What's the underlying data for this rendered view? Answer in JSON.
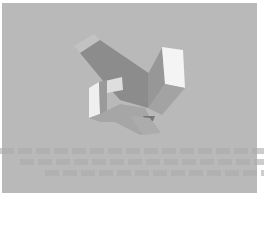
{
  "figure": {
    "background_color": "#b9b9b9",
    "page_color": "#ffffff",
    "faces": [
      {
        "name": "top-left-arm-cap",
        "color": "#c2c2c2",
        "points": "74,46 94,34 100,40 80,53"
      },
      {
        "name": "left-arm-top-face",
        "color": "#8c8c8c",
        "points": "80,53 100,40 150,74 162,70 162,88 148,108 120,100 104,82"
      },
      {
        "name": "right-block-side",
        "color": "#979797",
        "points": "148,74 162,48 165,84 148,108"
      },
      {
        "name": "right-block-front",
        "color": "#f4f4f4",
        "points": "162,47 183,50 185,88 165,84"
      },
      {
        "name": "right-block-bottom",
        "color": "#a3a3a3",
        "points": "165,84 185,88 162,115 148,108"
      },
      {
        "name": "center-window",
        "color": "#dedede",
        "points": "105,81 122,77 123,90 107,93"
      },
      {
        "name": "left-slab-front",
        "color": "#efefef",
        "points": "89,88 99,82 100,114 89,118"
      },
      {
        "name": "left-slab-inner",
        "color": "#9a9a9a",
        "points": "99,82 107,80 107,112 100,114"
      },
      {
        "name": "base-top",
        "color": "#a6a6a6",
        "points": "89,118 100,114 120,104 145,108 150,118 160,132 140,135 115,122 100,122"
      },
      {
        "name": "base-notch",
        "color": "#777777",
        "points": "143,116 155,116 153,121 145,121"
      },
      {
        "name": "lower-arm",
        "color": "#acacac",
        "points": "130,116 150,118 160,133 143,135"
      }
    ],
    "ghost_text_lines": 3
  }
}
